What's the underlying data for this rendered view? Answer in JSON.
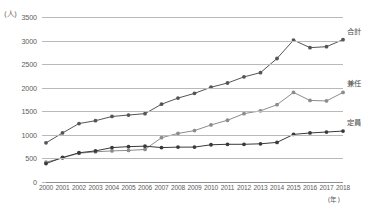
{
  "chart_data": {
    "type": "line",
    "title": "",
    "xlabel": "(年)",
    "ylabel": "(人)",
    "ylim": [
      0,
      3500
    ],
    "ytick_step": 500,
    "grid": true,
    "legend_position": "line-end-right",
    "categories": [
      "2000",
      "2001",
      "2002",
      "2003",
      "2004",
      "2005",
      "2006",
      "2007",
      "2008",
      "2009",
      "2010",
      "2011",
      "2012",
      "2013",
      "2014",
      "2015",
      "2016",
      "2017",
      "2018"
    ],
    "yticks": [
      "0",
      "500",
      "1000",
      "1500",
      "2000",
      "2500",
      "3000",
      "3500"
    ],
    "series": [
      {
        "name": "合計",
        "color": "#555555",
        "marker": "circle",
        "values": [
          830,
          1040,
          1240,
          1300,
          1390,
          1420,
          1450,
          1650,
          1780,
          1880,
          2010,
          2100,
          2230,
          2320,
          2620,
          3010,
          2850,
          2870,
          3020
        ]
      },
      {
        "name": "兼任",
        "color": "#8c8c8c",
        "marker": "circle",
        "values": [
          420,
          510,
          610,
          640,
          660,
          670,
          690,
          940,
          1030,
          1090,
          1210,
          1310,
          1450,
          1510,
          1640,
          1900,
          1730,
          1720,
          1900
        ]
      },
      {
        "name": "定員",
        "color": "#3a3a3a",
        "marker": "circle",
        "values": [
          390,
          520,
          620,
          660,
          730,
          750,
          760,
          730,
          740,
          740,
          790,
          800,
          800,
          810,
          840,
          1010,
          1040,
          1060,
          1080
        ]
      }
    ]
  }
}
